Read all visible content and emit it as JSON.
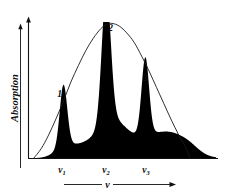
{
  "chart_data": {
    "type": "line",
    "title": "",
    "subtitle": "",
    "xlabel": "ν",
    "ylabel": "Absorption",
    "grid": false,
    "legend_position": "none",
    "xlim": [
      0,
      100
    ],
    "ylim": [
      0,
      100
    ],
    "axis_arrows": {
      "y_axis_arrow": "up",
      "x_axis_arrow": "right",
      "y_label_arrow": "up"
    },
    "xticks": [
      {
        "label": "ν",
        "sub": "1",
        "x": 18
      },
      {
        "label": "ν",
        "sub": "2",
        "x": 41
      },
      {
        "label": "ν",
        "sub": "3",
        "x": 62
      }
    ],
    "yticks": [],
    "annotations": [
      {
        "text": "1",
        "x": 18,
        "y": 38
      },
      {
        "text": "2",
        "x": 41,
        "y": 93
      },
      {
        "text": "3",
        "x": 62,
        "y": 55
      }
    ],
    "series": [
      {
        "name": "Envelope (broad absorption band)",
        "style": "thin-line",
        "color": "#1a1a1a",
        "x": [
          2,
          6,
          10,
          14,
          18,
          22,
          26,
          30,
          34,
          38,
          41,
          44,
          48,
          52,
          56,
          60,
          64,
          68,
          72,
          76,
          80,
          84,
          86
        ],
        "y": [
          0,
          7,
          17,
          29,
          42,
          56,
          68,
          79,
          88,
          95,
          98,
          99,
          97,
          92,
          85,
          75,
          64,
          52,
          40,
          28,
          17,
          7,
          0
        ]
      },
      {
        "name": "Sharp absorption lines",
        "style": "filled",
        "color": "#000000",
        "peaks": [
          {
            "center": 18,
            "height": 45,
            "width": 2.0
          },
          {
            "center": 41,
            "height": 96,
            "width": 2.4
          },
          {
            "center": 62,
            "height": 56,
            "width": 2.0
          }
        ]
      },
      {
        "name": "Broad background humps",
        "style": "filled",
        "color": "#000000",
        "humps": [
          {
            "center": 29,
            "height": 9,
            "width": 8.5
          },
          {
            "center": 47,
            "height": 22,
            "width": 8.0
          },
          {
            "center": 74,
            "height": 19,
            "width": 10.0
          },
          {
            "center": 41,
            "height": 7,
            "width": 6.0
          },
          {
            "center": 18,
            "height": 5,
            "width": 5.0
          },
          {
            "center": 62,
            "height": 5,
            "width": 5.0
          },
          {
            "center": 86,
            "height": 3,
            "width": 5.0
          }
        ]
      }
    ]
  },
  "figure": {
    "background_color": "#ffffff",
    "ink_color": "#000000",
    "ylabel": "Absorption",
    "xlabel": "ν",
    "peak_labels": [
      "1",
      "2",
      "3"
    ],
    "tick_base": "ν",
    "tick_subscripts": [
      "1",
      "2",
      "3"
    ]
  }
}
